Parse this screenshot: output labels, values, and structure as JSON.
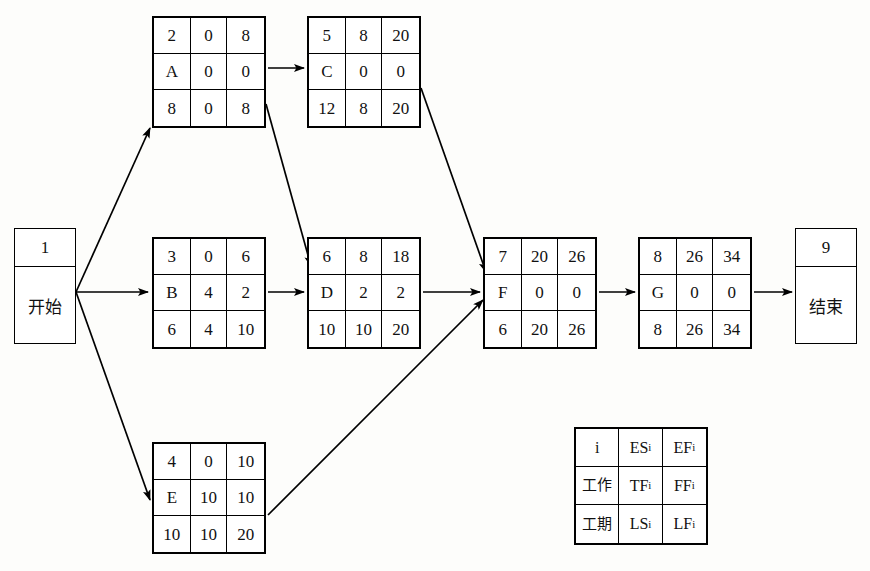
{
  "diagram": {
    "type": "project-network-diagram",
    "stroke_color": "#000000",
    "background_color": "#fdfdfb"
  },
  "terminals": [
    {
      "id": "start",
      "number": "1",
      "label": "开始",
      "x": 14,
      "y": 228,
      "w": 62,
      "h": 116
    },
    {
      "id": "end",
      "number": "9",
      "label": "结束",
      "x": 795,
      "y": 228,
      "w": 62,
      "h": 116
    }
  ],
  "nodes": [
    {
      "id": "A",
      "x": 152,
      "y": 16,
      "w": 114,
      "h": 112,
      "cells": [
        "2",
        "0",
        "8",
        "A",
        "0",
        "0",
        "8",
        "0",
        "8"
      ],
      "i": "2",
      "ES": "0",
      "EF": "8",
      "work": "A",
      "TF": "0",
      "FF": "0",
      "duration": "8",
      "LS": "0",
      "LF": "8"
    },
    {
      "id": "C",
      "x": 307,
      "y": 16,
      "w": 114,
      "h": 112,
      "cells": [
        "5",
        "8",
        "20",
        "C",
        "0",
        "0",
        "12",
        "8",
        "20"
      ],
      "i": "5",
      "ES": "8",
      "EF": "20",
      "work": "C",
      "TF": "0",
      "FF": "0",
      "duration": "12",
      "LS": "8",
      "LF": "20"
    },
    {
      "id": "B",
      "x": 152,
      "y": 237,
      "w": 114,
      "h": 112,
      "cells": [
        "3",
        "0",
        "6",
        "B",
        "4",
        "2",
        "6",
        "4",
        "10"
      ],
      "i": "3",
      "ES": "0",
      "EF": "6",
      "work": "B",
      "TF": "4",
      "FF": "2",
      "duration": "6",
      "LS": "4",
      "LF": "10"
    },
    {
      "id": "D",
      "x": 307,
      "y": 237,
      "w": 114,
      "h": 112,
      "cells": [
        "6",
        "8",
        "18",
        "D",
        "2",
        "2",
        "10",
        "10",
        "20"
      ],
      "i": "6",
      "ES": "8",
      "EF": "18",
      "work": "D",
      "TF": "2",
      "FF": "2",
      "duration": "10",
      "LS": "10",
      "LF": "20"
    },
    {
      "id": "F",
      "x": 483,
      "y": 237,
      "w": 114,
      "h": 112,
      "cells": [
        "7",
        "20",
        "26",
        "F",
        "0",
        "0",
        "6",
        "20",
        "26"
      ],
      "i": "7",
      "ES": "20",
      "EF": "26",
      "work": "F",
      "TF": "0",
      "FF": "0",
      "duration": "6",
      "LS": "20",
      "LF": "26"
    },
    {
      "id": "G",
      "x": 638,
      "y": 237,
      "w": 114,
      "h": 112,
      "cells": [
        "8",
        "26",
        "34",
        "G",
        "0",
        "0",
        "8",
        "26",
        "34"
      ],
      "i": "8",
      "ES": "26",
      "EF": "34",
      "work": "G",
      "TF": "0",
      "FF": "0",
      "duration": "8",
      "LS": "26",
      "LF": "34"
    },
    {
      "id": "E",
      "x": 152,
      "y": 442,
      "w": 114,
      "h": 112,
      "cells": [
        "4",
        "0",
        "10",
        "E",
        "10",
        "10",
        "10",
        "10",
        "20"
      ],
      "i": "4",
      "ES": "0",
      "EF": "10",
      "work": "E",
      "TF": "10",
      "FF": "10",
      "duration": "10",
      "LS": "10",
      "LF": "20"
    }
  ],
  "edges": [
    {
      "from": "start",
      "to": "A",
      "x1": 76,
      "y1": 292,
      "x2": 150,
      "y2": 128
    },
    {
      "from": "start",
      "to": "B",
      "x1": 76,
      "y1": 292,
      "x2": 148,
      "y2": 292
    },
    {
      "from": "start",
      "to": "E",
      "x1": 76,
      "y1": 292,
      "x2": 150,
      "y2": 500
    },
    {
      "from": "A",
      "to": "C",
      "x1": 268,
      "y1": 68,
      "x2": 304,
      "y2": 68
    },
    {
      "from": "A",
      "to": "D",
      "x1": 266,
      "y1": 104,
      "x2": 311,
      "y2": 266
    },
    {
      "from": "B",
      "to": "D",
      "x1": 268,
      "y1": 292,
      "x2": 304,
      "y2": 292
    },
    {
      "from": "C",
      "to": "F",
      "x1": 421,
      "y1": 88,
      "x2": 486,
      "y2": 272
    },
    {
      "from": "D",
      "to": "F",
      "x1": 423,
      "y1": 292,
      "x2": 480,
      "y2": 292
    },
    {
      "from": "E",
      "to": "F",
      "x1": 268,
      "y1": 515,
      "x2": 483,
      "y2": 300
    },
    {
      "from": "F",
      "to": "G",
      "x1": 599,
      "y1": 292,
      "x2": 635,
      "y2": 292
    },
    {
      "from": "G",
      "to": "end",
      "x1": 754,
      "y1": 292,
      "x2": 792,
      "y2": 292
    }
  ],
  "legend": {
    "x": 574,
    "y": 427,
    "w": 134,
    "h": 118,
    "cells": [
      {
        "text": "i",
        "sub": "",
        "cn": false
      },
      {
        "text": "ES",
        "sub": "i",
        "cn": false
      },
      {
        "text": "EF",
        "sub": "i",
        "cn": false
      },
      {
        "text": "工作",
        "sub": "",
        "cn": true
      },
      {
        "text": "TF",
        "sub": "i",
        "cn": false
      },
      {
        "text": "FF",
        "sub": "i",
        "cn": false
      },
      {
        "text": "工期",
        "sub": "",
        "cn": true
      },
      {
        "text": "LS",
        "sub": "i",
        "cn": false
      },
      {
        "text": "LF",
        "sub": "i",
        "cn": false
      }
    ]
  }
}
